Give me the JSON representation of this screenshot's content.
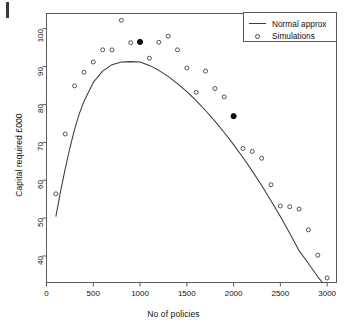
{
  "figure": {
    "background": "#ffffff",
    "frame_color": "#5a5a5a",
    "page_edge_mark": "page-edge-artifact"
  },
  "chart_data": {
    "type": "scatter",
    "title": "",
    "xlabel": "No of policies",
    "ylabel": "Capital required £000",
    "xlim": [
      0,
      3100
    ],
    "ylim": [
      33,
      104
    ],
    "xticks": [
      0,
      500,
      1000,
      1500,
      2000,
      2500,
      3000
    ],
    "yticks": [
      40,
      50,
      60,
      70,
      80,
      90,
      100
    ],
    "grid": false,
    "legend_position": "top-right",
    "series": [
      {
        "name": "Normal approx",
        "type": "line",
        "marker": "none",
        "color": "#3c3c3c",
        "x": [
          100,
          150,
          200,
          250,
          300,
          350,
          400,
          500,
          600,
          700,
          800,
          900,
          1000,
          1100,
          1200,
          1300,
          1400,
          1500,
          1600,
          1700,
          1800,
          1900,
          2000,
          2100,
          2200,
          2300,
          2400,
          2500,
          2600,
          2700,
          2800,
          2900,
          2950
        ],
        "y": [
          50.4,
          57.0,
          63.0,
          68.5,
          73.4,
          77.5,
          80.8,
          85.8,
          88.8,
          90.5,
          91.2,
          91.3,
          91.2,
          90.3,
          89.0,
          87.4,
          85.5,
          83.4,
          81.0,
          78.4,
          75.6,
          72.6,
          69.4,
          66.0,
          62.4,
          58.6,
          54.6,
          50.4,
          46.0,
          41.4,
          38.0,
          34.5,
          33.0
        ]
      },
      {
        "name": "Simulations",
        "type": "scatter",
        "marker": "open-circle",
        "color": "#4a4a4a",
        "points": [
          {
            "x": 100,
            "y": 56.4,
            "filled": false
          },
          {
            "x": 200,
            "y": 72.2,
            "filled": false
          },
          {
            "x": 300,
            "y": 84.9,
            "filled": false
          },
          {
            "x": 400,
            "y": 88.5,
            "filled": false
          },
          {
            "x": 500,
            "y": 91.2,
            "filled": false
          },
          {
            "x": 600,
            "y": 94.4,
            "filled": false
          },
          {
            "x": 700,
            "y": 94.4,
            "filled": false
          },
          {
            "x": 800,
            "y": 102.2,
            "filled": false
          },
          {
            "x": 900,
            "y": 96.3,
            "filled": false
          },
          {
            "x": 1000,
            "y": 96.5,
            "filled": true
          },
          {
            "x": 1100,
            "y": 92.2,
            "filled": false
          },
          {
            "x": 1200,
            "y": 96.4,
            "filled": false
          },
          {
            "x": 1300,
            "y": 98.0,
            "filled": false
          },
          {
            "x": 1400,
            "y": 94.4,
            "filled": false
          },
          {
            "x": 1500,
            "y": 89.6,
            "filled": false
          },
          {
            "x": 1600,
            "y": 83.2,
            "filled": false
          },
          {
            "x": 1700,
            "y": 88.8,
            "filled": false
          },
          {
            "x": 1800,
            "y": 84.2,
            "filled": false
          },
          {
            "x": 1900,
            "y": 82.0,
            "filled": false
          },
          {
            "x": 2000,
            "y": 76.9,
            "filled": true
          },
          {
            "x": 2100,
            "y": 68.4,
            "filled": false
          },
          {
            "x": 2200,
            "y": 67.6,
            "filled": false
          },
          {
            "x": 2300,
            "y": 65.8,
            "filled": false
          },
          {
            "x": 2400,
            "y": 58.8,
            "filled": false
          },
          {
            "x": 2500,
            "y": 53.2,
            "filled": false
          },
          {
            "x": 2600,
            "y": 53.0,
            "filled": false
          },
          {
            "x": 2700,
            "y": 52.4,
            "filled": false
          },
          {
            "x": 2800,
            "y": 46.9,
            "filled": false
          },
          {
            "x": 2900,
            "y": 40.2,
            "filled": false
          },
          {
            "x": 3000,
            "y": 34.2,
            "filled": false
          }
        ]
      }
    ],
    "legend": [
      {
        "label": "Normal approx",
        "key": "line"
      },
      {
        "label": "Simulations",
        "key": "open-circle"
      }
    ]
  }
}
